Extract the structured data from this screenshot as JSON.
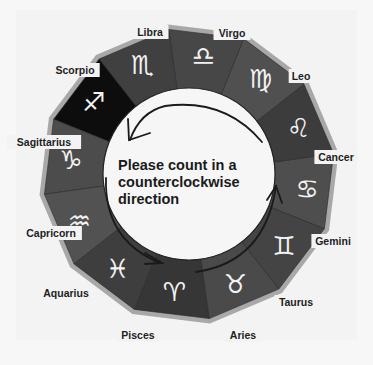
{
  "diagram": {
    "center": {
      "x": 189,
      "y": 174
    },
    "outer_radius": 146,
    "inner_radius": 86,
    "instruction": {
      "lines": [
        "Please count in a",
        "counterclockwise",
        "direction"
      ]
    },
    "colors": {
      "ring_dark": "#3a3a3a",
      "ring_mid": "#555555",
      "ring_light": "#6b6b6b",
      "rim": "#a8a8a8",
      "sagittarius": "#0d0d0d",
      "inner_circle": "#f6f6f6",
      "arrow": "#1a1a1a"
    },
    "signs": [
      {
        "name": "Aries",
        "glyph": "♈",
        "icon": "aries-icon",
        "angle": 97,
        "shade": "#363636",
        "label_x": 243,
        "label_y": 339
      },
      {
        "name": "Taurus",
        "glyph": "♉",
        "icon": "taurus-icon",
        "angle": 67,
        "shade": "#4a4a4a",
        "label_x": 296,
        "label_y": 306
      },
      {
        "name": "Gemini",
        "glyph": "♊",
        "icon": "gemini-icon",
        "angle": 37,
        "shade": "#444444",
        "label_x": 333,
        "label_y": 245
      },
      {
        "name": "Cancer",
        "glyph": "♋",
        "icon": "cancer-icon",
        "angle": 7,
        "shade": "#4e4e4e",
        "label_x": 336,
        "label_y": 161
      },
      {
        "name": "Leo",
        "glyph": "♌",
        "icon": "leo-icon",
        "angle": -23,
        "shade": "#3c3c3c",
        "label_x": 301,
        "label_y": 80
      },
      {
        "name": "Virgo",
        "glyph": "♍",
        "icon": "virgo-icon",
        "angle": -53,
        "shade": "#505050",
        "label_x": 232,
        "label_y": 37
      },
      {
        "name": "Libra",
        "glyph": "♎",
        "icon": "libra-icon",
        "angle": -83,
        "shade": "#474747",
        "label_x": 150,
        "label_y": 36
      },
      {
        "name": "Scorpio",
        "glyph": "♏",
        "icon": "scorpio-icon",
        "angle": -113,
        "shade": "#404040",
        "label_x": 75,
        "label_y": 74
      },
      {
        "name": "Sagittarius",
        "glyph": "♐",
        "icon": "sagittarius-icon",
        "angle": -143,
        "shade": "#0d0d0d",
        "label_x": 44,
        "label_y": 146
      },
      {
        "name": "Capricorn",
        "glyph": "♑",
        "icon": "capricorn-icon",
        "angle": -173,
        "shade": "#4c4c4c",
        "label_x": 51,
        "label_y": 237
      },
      {
        "name": "Aquarius",
        "glyph": "♒",
        "icon": "aquarius-icon",
        "angle": 157,
        "shade": "#525252",
        "label_x": 66,
        "label_y": 297
      },
      {
        "name": "Pisces",
        "glyph": "♓",
        "icon": "pisces-icon",
        "angle": 127,
        "shade": "#3e3e3e",
        "label_x": 138,
        "label_y": 339
      }
    ]
  }
}
